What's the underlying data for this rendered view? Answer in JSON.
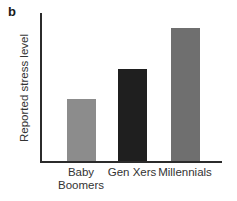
{
  "panel_label": "b",
  "chart_data": {
    "type": "bar",
    "title": "",
    "xlabel": "",
    "ylabel": "Reported stress level",
    "categories": [
      "Baby Boomers",
      "Gen Xers",
      "Millennials"
    ],
    "values": [
      0.42,
      0.62,
      0.9
    ],
    "value_note": "relative bar heights; y-axis has no numeric tick labels",
    "ylim": [
      0,
      1
    ],
    "yticks": [],
    "bar_colors": [
      "#8c8c8c",
      "#1f1f1f",
      "#6f6f6f"
    ],
    "axis_color": "#2b2b2b",
    "grid": false,
    "legend": "none"
  }
}
